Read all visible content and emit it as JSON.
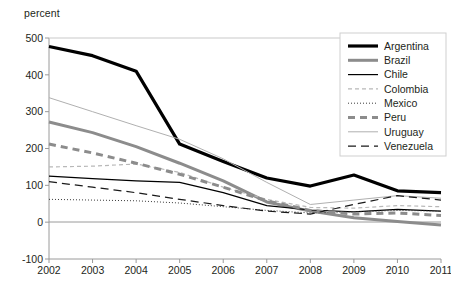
{
  "axis_unit_label": "percent",
  "legend": {
    "position": "top-right",
    "entries": [
      {
        "label": "Argentina",
        "color": "#000000",
        "width": 3.2,
        "dash": "none"
      },
      {
        "label": "Brazil",
        "color": "#8c8c8c",
        "width": 3.0,
        "dash": "none"
      },
      {
        "label": "Chile",
        "color": "#000000",
        "width": 1.2,
        "dash": "none"
      },
      {
        "label": "Colombia",
        "color": "#b8b8b8",
        "width": 1.2,
        "dash": "4,3"
      },
      {
        "label": "Mexico",
        "color": "#3a3a3a",
        "width": 1.0,
        "dash": "1,2"
      },
      {
        "label": "Peru",
        "color": "#8c8c8c",
        "width": 3.0,
        "dash": "7,5"
      },
      {
        "label": "Uruguay",
        "color": "#b0b0b0",
        "width": 1.0,
        "dash": "none"
      },
      {
        "label": "Venezuela",
        "color": "#1a1a1a",
        "width": 1.2,
        "dash": "8,5"
      }
    ]
  },
  "chart_data": {
    "type": "line",
    "title": "",
    "subtitle": "",
    "xlabel": "",
    "ylabel": "percent",
    "grid": false,
    "legend_position": "top-right",
    "x": [
      2002,
      2003,
      2004,
      2005,
      2006,
      2007,
      2008,
      2009,
      2010,
      2011
    ],
    "categories": [
      "2002",
      "2003",
      "2004",
      "2005",
      "2006",
      "2007",
      "2008",
      "2009",
      "2010",
      "2011"
    ],
    "xlim": [
      2002,
      2011
    ],
    "ylim": [
      -100,
      500
    ],
    "ytick_labels": [
      "500",
      "400",
      "300",
      "200",
      "100",
      "0",
      "-100"
    ],
    "yticks": [
      500,
      400,
      300,
      200,
      100,
      0,
      -100
    ],
    "series": [
      {
        "name": "Argentina",
        "values": [
          477,
          452,
          410,
          212,
          165,
          120,
          98,
          128,
          85,
          80
        ]
      },
      {
        "name": "Brazil",
        "values": [
          272,
          243,
          205,
          160,
          112,
          55,
          30,
          12,
          2,
          -8
        ]
      },
      {
        "name": "Chile",
        "values": [
          125,
          118,
          112,
          108,
          80,
          45,
          33,
          28,
          35,
          30
        ]
      },
      {
        "name": "Colombia",
        "values": [
          150,
          152,
          158,
          135,
          95,
          62,
          40,
          38,
          45,
          42
        ]
      },
      {
        "name": "Mexico",
        "values": [
          62,
          60,
          58,
          52,
          42,
          32,
          25,
          28,
          32,
          30
        ]
      },
      {
        "name": "Peru",
        "values": [
          212,
          188,
          160,
          130,
          95,
          58,
          32,
          22,
          25,
          18
        ]
      },
      {
        "name": "Uruguay",
        "values": [
          338,
          300,
          262,
          225,
          172,
          108,
          48,
          60,
          72,
          65
        ]
      },
      {
        "name": "Venezuela",
        "values": [
          110,
          95,
          80,
          62,
          45,
          30,
          22,
          48,
          72,
          60
        ]
      }
    ]
  }
}
